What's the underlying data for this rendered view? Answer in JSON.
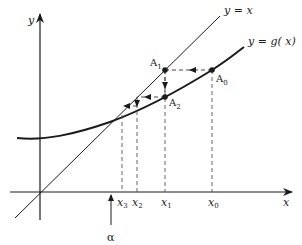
{
  "figure": {
    "axes": {
      "x_label": "x",
      "y_label": "y"
    },
    "lines": {
      "identity_label": "y = x",
      "curve_label": "y = g( x)"
    },
    "points": [
      {
        "name": "A",
        "sub": "0"
      },
      {
        "name": "A",
        "sub": "1"
      },
      {
        "name": "A",
        "sub": "2"
      }
    ],
    "ticks": [
      {
        "name": "x",
        "sub": "3"
      },
      {
        "name": "x",
        "sub": "2"
      },
      {
        "name": "x",
        "sub": "1"
      },
      {
        "name": "x",
        "sub": "0"
      }
    ],
    "fixed_point_label": "α",
    "colors": {
      "ink": "#1a1a1a",
      "dashed": "#555555",
      "background": "#ffffff"
    }
  }
}
